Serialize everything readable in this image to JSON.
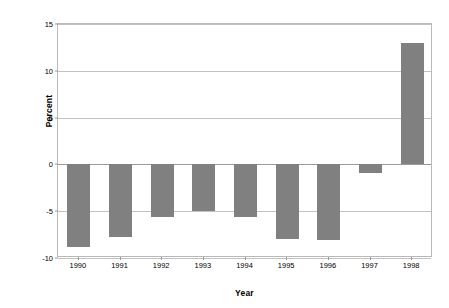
{
  "chart_data": {
    "type": "bar",
    "title": "",
    "subtitle": "",
    "xlabel": "Year",
    "ylabel": "Percent",
    "categories": [
      "1990",
      "1991",
      "1992",
      "1993",
      "1994",
      "1995",
      "1996",
      "1997",
      "1998"
    ],
    "values": [
      -8.8,
      -7.8,
      -5.6,
      -5.0,
      -5.6,
      -8.0,
      -8.1,
      -0.9,
      13.0
    ],
    "series": [
      {
        "name": "Percent",
        "values": [
          -8.8,
          -7.8,
          -5.6,
          -5.0,
          -5.6,
          -8.0,
          -8.1,
          -0.9,
          13.0
        ]
      }
    ],
    "ylim": [
      -10,
      15
    ],
    "yticks": [
      15,
      10,
      5,
      0,
      -5,
      -10
    ],
    "ytick_labels": [
      "15",
      "10",
      "5",
      "0",
      "-5",
      "-10"
    ],
    "xtick_labels": [
      "1990",
      "1991",
      "1992",
      "1993",
      "1994",
      "1995",
      "1996",
      "1997",
      "1998"
    ],
    "grid": true,
    "grid_axis": "y",
    "legend": false,
    "legend_position": "none",
    "bar_color": "#808080",
    "gridline_color": "#c2c2c2",
    "zero_line_color": "#9a9a9a",
    "plot_border_color": "#b9b9b9",
    "background_color": "#ffffff",
    "text_color": "#000000",
    "bar_width_ratio": 0.55
  }
}
